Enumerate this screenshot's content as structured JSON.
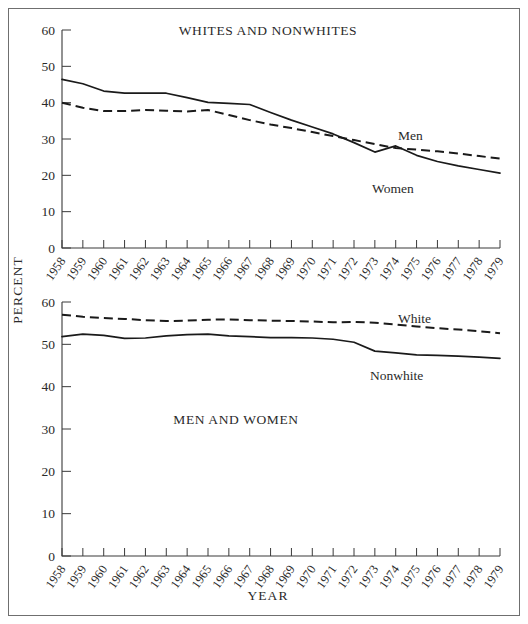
{
  "figure": {
    "y_axis_title": "PERCENT",
    "x_axis_title": "YEAR"
  },
  "chart_data": [
    {
      "type": "line",
      "title": "WHITES AND NONWHITES",
      "panel": "top",
      "xlabel": "YEAR",
      "ylabel": "PERCENT",
      "ylim": [
        0,
        60
      ],
      "yticks": [
        0,
        10,
        20,
        30,
        40,
        50,
        60
      ],
      "grid": false,
      "legend": "inline-labels",
      "categories": [
        "1958",
        "1959",
        "1960",
        "1961",
        "1962",
        "1963",
        "1964",
        "1965",
        "1966",
        "1967",
        "1968",
        "1969",
        "1970",
        "1971",
        "1972",
        "1973",
        "1974",
        "1975",
        "1976",
        "1977",
        "1978",
        "1979"
      ],
      "series": [
        {
          "name": "Men",
          "style": "dashed",
          "label_x": "1973",
          "values": [
            40.0,
            38.6,
            37.7,
            37.7,
            38.0,
            37.8,
            37.6,
            38.0,
            36.6,
            35.2,
            34.0,
            33.0,
            31.9,
            30.8,
            29.7,
            28.6,
            27.5,
            27.1,
            26.6,
            26.0,
            25.3,
            24.6
          ]
        },
        {
          "name": "Women",
          "style": "solid",
          "label_x": "1974",
          "values": [
            46.4,
            45.2,
            43.2,
            42.6,
            42.6,
            42.6,
            41.4,
            40.1,
            39.8,
            39.5,
            37.3,
            35.2,
            33.3,
            31.4,
            29.0,
            26.4,
            28.1,
            25.5,
            23.8,
            22.6,
            21.6,
            20.6,
            18.2
          ]
        }
      ]
    },
    {
      "type": "line",
      "title": "MEN AND WOMEN",
      "panel": "bottom",
      "xlabel": "YEAR",
      "ylabel": "PERCENT",
      "ylim": [
        0,
        60
      ],
      "yticks": [
        0,
        10,
        20,
        30,
        40,
        50,
        60
      ],
      "grid": false,
      "legend": "inline-labels",
      "categories": [
        "1958",
        "1959",
        "1960",
        "1961",
        "1962",
        "1963",
        "1964",
        "1965",
        "1966",
        "1967",
        "1968",
        "1969",
        "1970",
        "1971",
        "1972",
        "1973",
        "1974",
        "1975",
        "1976",
        "1977",
        "1978",
        "1979"
      ],
      "series": [
        {
          "name": "White",
          "style": "dashed",
          "label_x": "1973",
          "values": [
            57.0,
            56.5,
            56.2,
            56.0,
            55.7,
            55.5,
            55.6,
            55.8,
            55.9,
            55.7,
            55.6,
            55.5,
            55.4,
            55.2,
            55.3,
            55.1,
            54.7,
            54.2,
            53.8,
            53.5,
            53.1,
            52.6
          ]
        },
        {
          "name": "Nonwhite",
          "style": "solid",
          "label_x": "1974",
          "values": [
            51.8,
            52.4,
            52.1,
            51.4,
            51.5,
            52.0,
            52.3,
            52.4,
            52.0,
            51.8,
            51.6,
            51.6,
            51.5,
            51.2,
            50.5,
            48.4,
            48.0,
            47.5,
            47.4,
            47.2,
            47.0,
            46.7
          ]
        }
      ]
    }
  ]
}
